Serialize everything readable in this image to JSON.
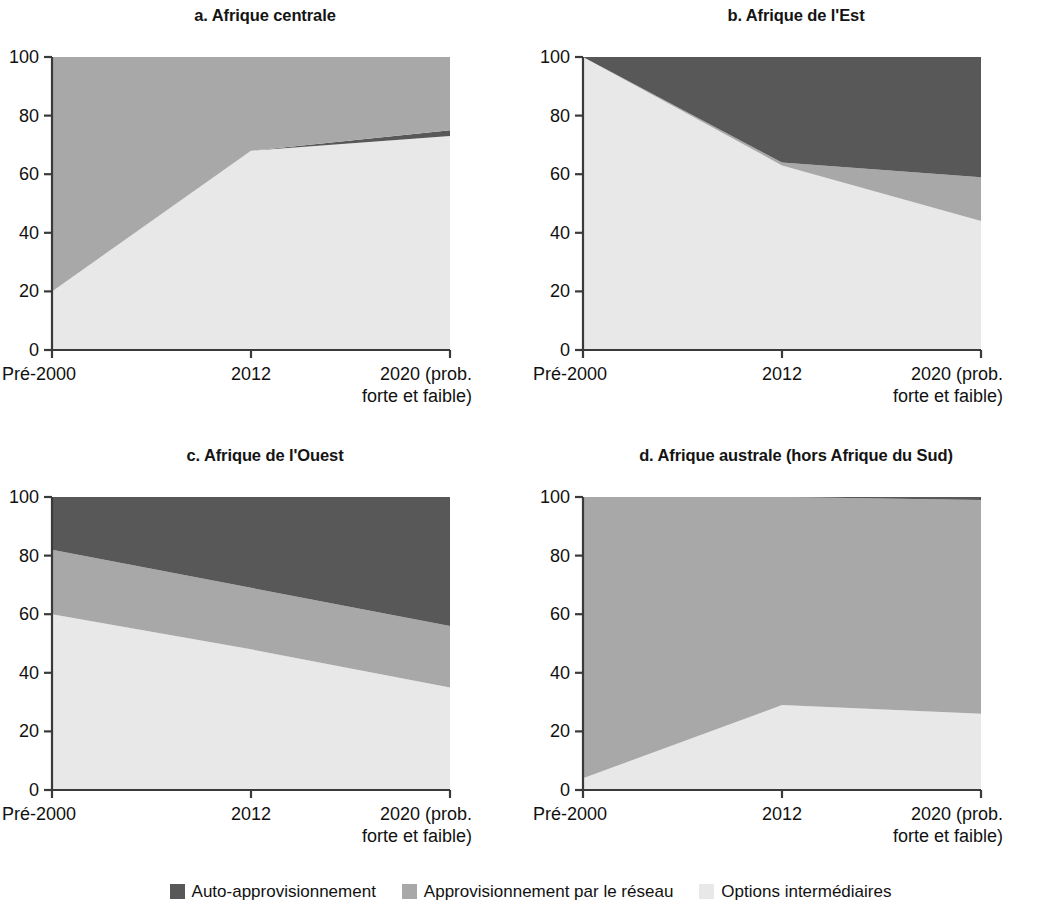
{
  "figure": {
    "width": 1061,
    "height": 907,
    "background": "#ffffff"
  },
  "colors": {
    "self_supply": "#585858",
    "network_supply": "#a8a8a8",
    "intermediate_options": "#e8e8e8",
    "axis": "#3a3a3a",
    "text": "#111111"
  },
  "legend": {
    "position": "bottom-center",
    "items": [
      {
        "label": "Auto-approvisionnement",
        "color": "#585858",
        "swatch": "legend-swatch-self-supply"
      },
      {
        "label": "Approvisionnement par le réseau",
        "color": "#a8a8a8",
        "swatch": "legend-swatch-network"
      },
      {
        "label": "Options intermédiaires",
        "color": "#e8e8e8",
        "swatch": "legend-swatch-intermediate"
      }
    ]
  },
  "axes": {
    "y_ticks": [
      "0",
      "20",
      "40",
      "60",
      "80",
      "100"
    ],
    "y_values": [
      0,
      20,
      40,
      60,
      80,
      100
    ],
    "ylim": [
      0,
      100
    ],
    "x_ticks": [
      "Pré-2000",
      "2012",
      "2020 (prob.\nforte et faible)"
    ],
    "x_tick_line1": [
      "Pré-2000",
      "2012",
      "2020 (prob."
    ],
    "x_tick_line2": [
      "",
      "",
      "forte et faible)"
    ],
    "grid": false
  },
  "panels": [
    {
      "key": "a",
      "title": "a. Afrique centrale"
    },
    {
      "key": "b",
      "title": "b. Afrique de l'Est"
    },
    {
      "key": "c",
      "title": "c. Afrique de l'Ouest"
    },
    {
      "key": "d",
      "title": "d. Afrique australe (hors Afrique du Sud)"
    }
  ],
  "chart_data": [
    {
      "type": "area",
      "stacked": true,
      "title": "a. Afrique centrale",
      "panel": "a",
      "xlabel": "",
      "ylabel": "",
      "ylim": [
        0,
        100
      ],
      "grid": false,
      "legend_position": "bottom-center",
      "categories": [
        "Pré-2000",
        "2012",
        "2020 (prob. forte et faible)"
      ],
      "series": [
        {
          "name": "Options intermédiaires",
          "color": "#e8e8e8",
          "values": [
            20,
            68,
            73
          ]
        },
        {
          "name": "Approvisionnement par le réseau",
          "color": "#a8a8a8",
          "values": [
            80,
            32,
            25
          ]
        },
        {
          "name": "Auto-approvisionnement",
          "color": "#585858",
          "values": [
            0,
            0,
            2
          ]
        }
      ],
      "cumulative_tops": {
        "intermediate": [
          20,
          68,
          73
        ],
        "intermediate_plus_self": [
          20,
          68,
          75
        ],
        "total": [
          100,
          100,
          100
        ]
      }
    },
    {
      "type": "area",
      "stacked": true,
      "title": "b. Afrique de l'Est",
      "panel": "b",
      "xlabel": "",
      "ylabel": "",
      "ylim": [
        0,
        100
      ],
      "grid": false,
      "legend_position": "bottom-center",
      "categories": [
        "Pré-2000",
        "2012",
        "2020 (prob. forte et faible)"
      ],
      "series": [
        {
          "name": "Options intermédiaires",
          "color": "#e8e8e8",
          "values": [
            100,
            63,
            44
          ]
        },
        {
          "name": "Approvisionnement par le réseau",
          "color": "#a8a8a8",
          "values": [
            0,
            1,
            15
          ]
        },
        {
          "name": "Auto-approvisionnement",
          "color": "#585858",
          "values": [
            0,
            36,
            41
          ]
        }
      ],
      "cumulative_tops": {
        "intermediate": [
          100,
          63,
          44
        ],
        "intermediate_plus_network": [
          100,
          64,
          59
        ],
        "total": [
          100,
          100,
          100
        ]
      }
    },
    {
      "type": "area",
      "stacked": true,
      "title": "c. Afrique de l'Ouest",
      "panel": "c",
      "xlabel": "",
      "ylabel": "",
      "ylim": [
        0,
        100
      ],
      "grid": false,
      "legend_position": "bottom-center",
      "categories": [
        "Pré-2000",
        "2012",
        "2020 (prob. forte et faible)"
      ],
      "series": [
        {
          "name": "Options intermédiaires",
          "color": "#e8e8e8",
          "values": [
            60,
            48,
            35
          ]
        },
        {
          "name": "Approvisionnement par le réseau",
          "color": "#a8a8a8",
          "values": [
            22,
            21,
            21
          ]
        },
        {
          "name": "Auto-approvisionnement",
          "color": "#585858",
          "values": [
            18,
            31,
            44
          ]
        }
      ],
      "cumulative_tops": {
        "intermediate": [
          60,
          48,
          35
        ],
        "intermediate_plus_network": [
          82,
          69,
          56
        ],
        "total": [
          100,
          100,
          100
        ]
      }
    },
    {
      "type": "area",
      "stacked": true,
      "title": "d. Afrique australe (hors Afrique du Sud)",
      "panel": "d",
      "xlabel": "",
      "ylabel": "",
      "ylim": [
        0,
        100
      ],
      "grid": false,
      "legend_position": "bottom-center",
      "categories": [
        "Pré-2000",
        "2012",
        "2020 (prob. forte et faible)"
      ],
      "series": [
        {
          "name": "Options intermédiaires",
          "color": "#e8e8e8",
          "values": [
            4,
            29,
            26
          ]
        },
        {
          "name": "Approvisionnement par le réseau",
          "color": "#a8a8a8",
          "values": [
            96,
            71,
            73
          ]
        },
        {
          "name": "Auto-approvisionnement",
          "color": "#585858",
          "values": [
            0,
            0,
            1
          ]
        }
      ],
      "cumulative_tops": {
        "intermediate": [
          4,
          29,
          26
        ],
        "intermediate_plus_network": [
          100,
          100,
          99
        ],
        "total": [
          100,
          100,
          100
        ]
      }
    }
  ]
}
